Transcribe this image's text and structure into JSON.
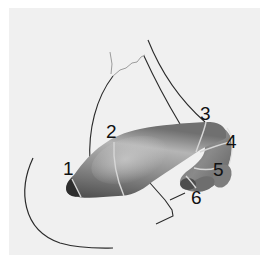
{
  "diagram": {
    "type": "anatomical-illustration",
    "colors": {
      "background": "#f0f0f0",
      "organ_dark": "#3a3a3a",
      "organ_mid": "#7a7a7a",
      "organ_light": "#bdbdbd",
      "segment_lines": "#d8d8d8",
      "outline": "#2a2a2a"
    },
    "labels": [
      {
        "id": "1",
        "text": "1"
      },
      {
        "id": "2",
        "text": "2"
      },
      {
        "id": "3",
        "text": "3"
      },
      {
        "id": "4",
        "text": "4"
      },
      {
        "id": "5",
        "text": "5"
      },
      {
        "id": "6",
        "text": "6"
      }
    ]
  }
}
